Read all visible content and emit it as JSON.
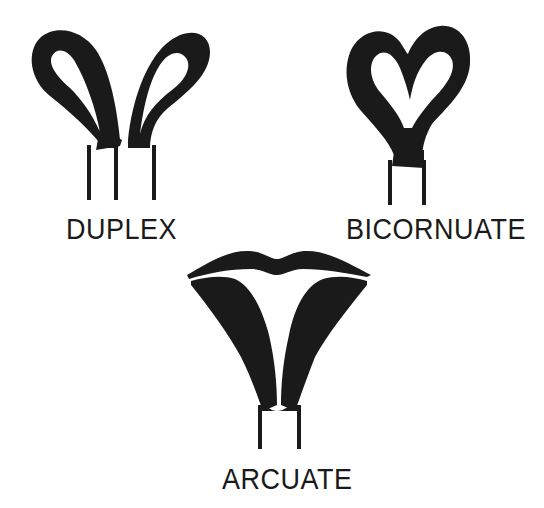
{
  "diagram": {
    "ink_color": "#1a1a1a",
    "background": "#ffffff",
    "figures": [
      {
        "id": "duplex",
        "label": "DUPLEX",
        "description": "two separate horn loops each with own cervix, three vertical lines below"
      },
      {
        "id": "bicornuate",
        "label": "BICORNUATE",
        "description": "heart-shaped uterus with single cervix, two vertical lines below"
      },
      {
        "id": "arcuate",
        "label": "ARCUATE",
        "description": "single body with slight fundal indentation (lip-like top), two vertical lines below"
      }
    ]
  }
}
